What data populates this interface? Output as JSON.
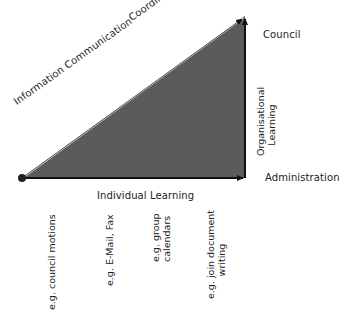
{
  "diagram": {
    "colors": {
      "triangle_fill": "#5b5b5b",
      "stroke": "#111111",
      "text": "#222222",
      "diagonal_stroke": "#ffffff"
    },
    "diagonal_labels": {
      "lower": "Information Communication",
      "upper": "Coordination/Cooperation"
    },
    "axes": {
      "horizontal": "Individual Learning",
      "vertical": "Organisational Learning",
      "vertical_line1": "Organisational",
      "vertical_line2": "Learning"
    },
    "levels": {
      "top": "Council",
      "bottom": "Administration"
    },
    "examples": [
      {
        "line1": "e.g. council motions",
        "line2": ""
      },
      {
        "line1": "e.g. E-Mail, Fax",
        "line2": ""
      },
      {
        "line1": "e.g. group",
        "line2": "calendars"
      },
      {
        "line1": "e.g. join document",
        "line2": "writing"
      }
    ]
  }
}
